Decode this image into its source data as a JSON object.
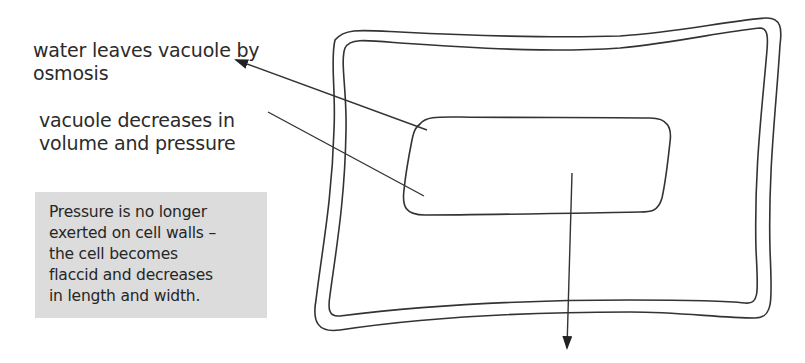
{
  "diagram": {
    "type": "plant cell losing water (plasmolysis / flaccid cell)",
    "labels": {
      "water_leaves": {
        "lines": [
          "water leaves vacuole by",
          "osmosis"
        ]
      },
      "vacuole_decreases": {
        "lines": [
          "vacuole decreases in",
          "volume and pressure"
        ]
      }
    },
    "note": {
      "lines": [
        "Pressure is no longer",
        "exerted on cell walls –",
        "the cell becomes",
        "flaccid and decreases",
        "in length and width."
      ],
      "background": "#dcdcdc"
    },
    "parts": [
      "cell-wall-outer",
      "cell-wall-inner",
      "vacuole",
      "water-out-arrow",
      "downward-shrink-arrow"
    ],
    "colors": {
      "line": "#333333",
      "text": "#2b2b2b"
    }
  }
}
